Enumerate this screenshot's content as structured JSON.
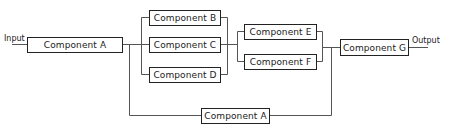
{
  "diagram": {
    "input_label": "Input",
    "output_label": "Output",
    "components": {
      "a_main": "Component A",
      "b": "Component B",
      "c": "Component C",
      "d": "Component D",
      "e": "Component E",
      "f": "Component F",
      "g": "Component G",
      "a_bypass": "Component A"
    },
    "line_color": "#555555",
    "box_border_color": "#222222"
  }
}
